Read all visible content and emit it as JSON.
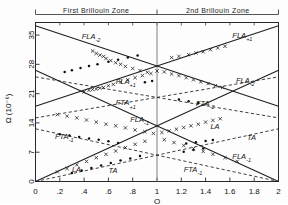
{
  "figure": {
    "zone_labels": [
      {
        "text": "First  Brillouin  Zone",
        "x": 0.5
      },
      {
        "text": "2nd  Brillouin  Zone",
        "x": 1.5
      }
    ],
    "axes": {
      "xlabel": "Q",
      "ylabel": "Ω (10⁻⁶)",
      "xlim": [
        0,
        2
      ],
      "ylim": [
        0,
        38
      ],
      "xticks": [
        0,
        0.2,
        0.4,
        0.6,
        0.8,
        1.0,
        1.2,
        1.4,
        1.6,
        1.8,
        2.0
      ],
      "xticklabels": [
        "0",
        ".2",
        ".4",
        ".6",
        ".8",
        "1",
        "1.2",
        "1.4",
        "1.6",
        "1.8",
        "2"
      ],
      "yticks": [
        0,
        7,
        14,
        21,
        28,
        35
      ],
      "yticklabels": [
        "0",
        "7",
        "14",
        "21",
        "28",
        "35"
      ],
      "grid": false,
      "zone_boundary_x": 1.0
    }
  },
  "chart_data": {
    "type": "line",
    "title": "",
    "xlabel": "Q",
    "ylabel": "Ω (10⁻⁶)",
    "xlim": [
      0,
      2
    ],
    "ylim": [
      0,
      38
    ],
    "grid": false,
    "legend_position": "inline-annotations",
    "series": [
      {
        "name": "FLA-2",
        "style": "solid",
        "x": [
          0.0,
          2.0
        ],
        "y": [
          37.2,
          18.0
        ],
        "label": "FLA",
        "sub": "-2"
      },
      {
        "name": "FLA+1",
        "style": "solid",
        "x": [
          0.0,
          2.0
        ],
        "y": [
          18.0,
          37.2
        ],
        "label": "FLA",
        "sub": "+1"
      },
      {
        "name": "FLA-1",
        "style": "solid",
        "x": [
          0.0,
          2.0
        ],
        "y": [
          0.0,
          26.6
        ],
        "label": "FLA",
        "sub": "-1"
      },
      {
        "name": "LA",
        "style": "solid",
        "x": [
          0.0,
          2.0
        ],
        "y": [
          26.6,
          0.0
        ],
        "label": "LA",
        "sub": ""
      },
      {
        "name": "FTA+1",
        "style": "dashed",
        "x": [
          0.0,
          2.0
        ],
        "y": [
          15.2,
          25.0
        ],
        "label": "FTA",
        "sub": "+1"
      },
      {
        "name": "FTA-2",
        "style": "dashed",
        "x": [
          0.0,
          2.0
        ],
        "y": [
          25.0,
          15.2
        ],
        "label": "FTA",
        "sub": "-2"
      },
      {
        "name": "FTA-1",
        "style": "dashed",
        "x": [
          0.0,
          2.0
        ],
        "y": [
          12.6,
          0.0
        ],
        "label": "FTA",
        "sub": "-1"
      },
      {
        "name": "TA",
        "style": "dashed",
        "x": [
          0.0,
          2.0
        ],
        "y": [
          0.0,
          12.6
        ],
        "label": "TA",
        "sub": ""
      }
    ],
    "annotations": [
      {
        "text": "FLA",
        "sub": "-2",
        "x": 0.38,
        "y": 34.0
      },
      {
        "text": "FLA",
        "sub": "+1",
        "x": 0.66,
        "y": 23.3
      },
      {
        "text": "FTA",
        "sub": "+1",
        "x": 0.66,
        "y": 18.2
      },
      {
        "text": "FLA",
        "sub": "-1",
        "x": 0.78,
        "y": 14.2
      },
      {
        "text": "FTA",
        "sub": "-1",
        "x": 0.16,
        "y": 10.2
      },
      {
        "text": "LA",
        "sub": "",
        "x": 0.3,
        "y": 2.3
      },
      {
        "text": "TA",
        "sub": "",
        "x": 0.6,
        "y": 2.0
      },
      {
        "text": "FLA",
        "sub": "+1",
        "x": 1.62,
        "y": 34.4
      },
      {
        "text": "FLA",
        "sub": "-2",
        "x": 1.65,
        "y": 23.6
      },
      {
        "text": "FTA",
        "sub": "-2",
        "x": 1.32,
        "y": 18.0
      },
      {
        "text": "LA",
        "sub": "",
        "x": 1.44,
        "y": 12.6
      },
      {
        "text": "TA",
        "sub": "",
        "x": 1.74,
        "y": 9.8
      },
      {
        "text": "FLA",
        "sub": "-1",
        "x": 1.62,
        "y": 5.4
      },
      {
        "text": "FTA",
        "sub": "-1",
        "x": 1.22,
        "y": 2.2
      }
    ],
    "data_points": {
      "marker_cross": [
        [
          0.47,
          31.2
        ],
        [
          0.5,
          30.6
        ],
        [
          0.53,
          30.2
        ],
        [
          0.56,
          29.9
        ],
        [
          0.58,
          29.4
        ],
        [
          0.62,
          28.9
        ],
        [
          0.66,
          28.4
        ],
        [
          0.7,
          28.0
        ],
        [
          0.74,
          27.5
        ],
        [
          0.8,
          27.0
        ],
        [
          0.86,
          26.5
        ],
        [
          0.92,
          26.1
        ],
        [
          0.4,
          21.4
        ],
        [
          0.44,
          21.8
        ],
        [
          0.47,
          22.0
        ],
        [
          0.5,
          22.1
        ],
        [
          0.53,
          22.3
        ],
        [
          0.56,
          22.5
        ],
        [
          0.6,
          22.9
        ],
        [
          0.64,
          23.2
        ],
        [
          0.7,
          23.8
        ],
        [
          0.76,
          24.3
        ],
        [
          0.82,
          24.8
        ],
        [
          0.88,
          25.3
        ],
        [
          0.95,
          25.8
        ],
        [
          1.0,
          26.4
        ],
        [
          1.06,
          26.2
        ],
        [
          1.12,
          25.7
        ],
        [
          1.18,
          25.3
        ],
        [
          1.24,
          24.8
        ],
        [
          1.3,
          24.3
        ],
        [
          1.36,
          23.8
        ],
        [
          1.42,
          23.4
        ],
        [
          1.48,
          22.9
        ],
        [
          1.54,
          22.5
        ],
        [
          1.12,
          29.6
        ],
        [
          1.18,
          29.9
        ],
        [
          1.26,
          30.3
        ],
        [
          1.32,
          30.7
        ],
        [
          1.38,
          31.0
        ],
        [
          1.44,
          31.5
        ],
        [
          1.5,
          31.9
        ],
        [
          1.56,
          32.3
        ],
        [
          0.18,
          16.0
        ],
        [
          0.26,
          15.6
        ],
        [
          0.34,
          15.2
        ],
        [
          0.42,
          14.7
        ],
        [
          0.5,
          14.2
        ],
        [
          0.58,
          13.7
        ],
        [
          0.66,
          13.3
        ],
        [
          0.74,
          12.8
        ],
        [
          0.82,
          12.3
        ],
        [
          0.9,
          11.9
        ],
        [
          0.97,
          11.5
        ],
        [
          1.04,
          11.7
        ],
        [
          1.1,
          12.1
        ],
        [
          1.16,
          12.5
        ],
        [
          1.22,
          12.9
        ],
        [
          1.28,
          13.3
        ],
        [
          1.34,
          13.7
        ],
        [
          1.4,
          14.2
        ],
        [
          1.46,
          14.6
        ],
        [
          1.52,
          15.0
        ],
        [
          0.18,
          2.3
        ],
        [
          0.26,
          3.1
        ],
        [
          0.34,
          4.0
        ],
        [
          0.42,
          4.8
        ],
        [
          0.5,
          5.7
        ],
        [
          0.58,
          6.5
        ],
        [
          0.66,
          7.3
        ],
        [
          0.74,
          8.1
        ],
        [
          0.82,
          8.9
        ],
        [
          0.9,
          9.6
        ],
        [
          1.06,
          10.0
        ],
        [
          1.14,
          9.3
        ],
        [
          1.22,
          8.6
        ],
        [
          1.3,
          7.9
        ],
        [
          1.38,
          7.2
        ],
        [
          1.46,
          6.5
        ],
        [
          1.56,
          5.7
        ],
        [
          1.66,
          4.8
        ]
      ],
      "marker_dot": [
        [
          0.24,
          26.2
        ],
        [
          0.3,
          26.6
        ],
        [
          0.37,
          27.1
        ],
        [
          0.44,
          27.6
        ],
        [
          0.51,
          28.0
        ],
        [
          0.6,
          28.6
        ],
        [
          0.68,
          29.1
        ],
        [
          0.76,
          29.6
        ],
        [
          0.84,
          30.1
        ],
        [
          0.9,
          23.7
        ],
        [
          0.96,
          24.0
        ],
        [
          1.18,
          19.6
        ],
        [
          1.26,
          19.2
        ],
        [
          1.34,
          18.8
        ],
        [
          0.2,
          11.3
        ],
        [
          0.28,
          11.0
        ],
        [
          0.36,
          10.6
        ],
        [
          0.44,
          10.3
        ],
        [
          0.52,
          10.0
        ],
        [
          0.6,
          9.6
        ],
        [
          0.68,
          9.2
        ],
        [
          1.24,
          9.1
        ],
        [
          1.32,
          9.4
        ],
        [
          1.4,
          9.7
        ],
        [
          1.46,
          9.9
        ],
        [
          0.3,
          2.0
        ],
        [
          0.38,
          2.6
        ],
        [
          0.46,
          3.2
        ],
        [
          0.54,
          3.8
        ],
        [
          0.62,
          4.4
        ],
        [
          0.7,
          5.0
        ],
        [
          0.78,
          5.5
        ],
        [
          0.86,
          6.1
        ],
        [
          1.22,
          7.1
        ],
        [
          1.3,
          7.5
        ],
        [
          1.38,
          7.9
        ]
      ]
    }
  }
}
